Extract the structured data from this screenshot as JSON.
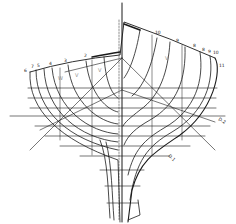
{
  "diagram": {
    "type": "ship-hull-body-plan",
    "colors": {
      "line": "#1a1a1a",
      "faint": "#8a8a8a",
      "background": "#ffffff"
    },
    "port_station_labels": [
      "6",
      "7",
      "5",
      "4",
      "3",
      "2"
    ],
    "starboard_station_labels": [
      "10",
      "9",
      "8",
      "8",
      "9",
      "10",
      "11"
    ],
    "diagonal_labels": [
      "D.2",
      "D.1"
    ],
    "interior_labels": [
      "W",
      "V",
      "V",
      "V"
    ]
  }
}
